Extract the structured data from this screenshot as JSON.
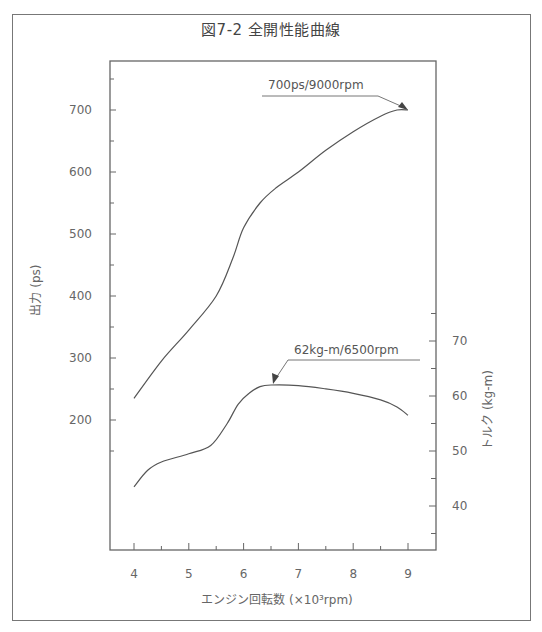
{
  "title": "図7-2 全開性能曲線",
  "chart_data": {
    "type": "line",
    "title": "図7-2 全開性能曲線",
    "xlabel": "エンジン回転数 (×10³rpm)",
    "x_ticks": [
      4,
      5,
      6,
      7,
      8,
      9
    ],
    "xlim": [
      3.55,
      9.5
    ],
    "y_left": {
      "label": "出力 (ps)",
      "ticks": [
        200,
        300,
        400,
        500,
        600,
        700
      ],
      "ylim": [
        -10,
        780
      ]
    },
    "y_right": {
      "label": "トルク (kg-m)",
      "ticks": [
        40,
        50,
        60,
        70
      ],
      "ylim": [
        32,
        120
      ]
    },
    "grid": false,
    "series": [
      {
        "name": "出力 (ps)",
        "axis": "left",
        "x": [
          4.0,
          4.5,
          5.0,
          5.5,
          5.8,
          6.0,
          6.3,
          6.6,
          7.0,
          7.5,
          8.0,
          8.5,
          8.8,
          9.0
        ],
        "values": [
          235,
          295,
          345,
          400,
          460,
          510,
          550,
          575,
          600,
          635,
          665,
          690,
          700,
          700
        ]
      },
      {
        "name": "トルク (kg-m)",
        "axis": "right",
        "x": [
          4.0,
          4.25,
          4.5,
          5.0,
          5.4,
          5.7,
          5.9,
          6.1,
          6.3,
          6.5,
          7.0,
          7.5,
          8.0,
          8.5,
          8.8,
          9.0
        ],
        "values": [
          43.5,
          46.5,
          48,
          49.5,
          51,
          55,
          58.5,
          60.5,
          61.7,
          62,
          61.9,
          61.3,
          60.5,
          59.3,
          58,
          56.5
        ]
      }
    ],
    "annotations": [
      {
        "text": "700ps/9000rpm",
        "x": 9.0,
        "y": 700,
        "axis": "left"
      },
      {
        "text": "62kg-m/6500rpm",
        "x": 6.5,
        "y": 62,
        "axis": "right"
      }
    ]
  },
  "annotations": {
    "power_peak": "700ps/9000rpm",
    "torque_peak": "62kg-m/6500rpm"
  },
  "axes": {
    "x_label": "エンジン回転数 (×10³rpm)",
    "x_ticks": [
      "4",
      "5",
      "6",
      "7",
      "8",
      "9"
    ],
    "left_label": "出力 (ps)",
    "left_ticks": [
      "700",
      "600",
      "500",
      "400",
      "300",
      "200"
    ],
    "right_label": "トルク (kg-m)",
    "right_ticks": [
      "70",
      "60",
      "50",
      "40"
    ]
  }
}
